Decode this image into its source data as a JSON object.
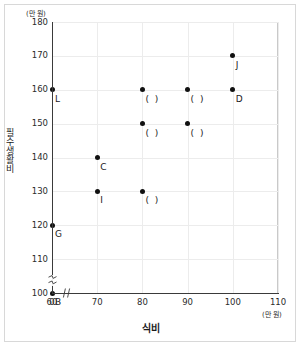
{
  "chart_data": {
    "type": "scatter",
    "title": "",
    "xlabel": "식비",
    "ylabel": "필수생활비",
    "x_unit": "(만 원)",
    "y_unit": "(만 원)",
    "xlim": [
      60,
      110
    ],
    "ylim": [
      100,
      180
    ],
    "grid": true,
    "legend": "none",
    "x_origin_label": "0",
    "x_ticks": [
      "60",
      "70",
      "80",
      "90",
      "100",
      "110"
    ],
    "x_tick_values": [
      60,
      70,
      80,
      90,
      100,
      110
    ],
    "y_ticks": [
      "100",
      "110",
      "120",
      "130",
      "140",
      "150",
      "160",
      "170",
      "180"
    ],
    "y_tick_values": [
      100,
      110,
      120,
      130,
      140,
      150,
      160,
      170,
      180
    ],
    "axis_breaks": {
      "x": true,
      "y": true
    },
    "points": [
      {
        "x": 60,
        "y": 100,
        "label": "B",
        "label_pos": "below-right"
      },
      {
        "x": 60,
        "y": 120,
        "label": "G",
        "label_pos": "below-right"
      },
      {
        "x": 60,
        "y": 160,
        "label": "L",
        "label_pos": "below-right"
      },
      {
        "x": 70,
        "y": 130,
        "label": "I",
        "label_pos": "below-right"
      },
      {
        "x": 70,
        "y": 140,
        "label": "C",
        "label_pos": "below-right"
      },
      {
        "x": 80,
        "y": 130,
        "label": "( )",
        "label_pos": "below-right"
      },
      {
        "x": 80,
        "y": 150,
        "label": "( )",
        "label_pos": "below-right"
      },
      {
        "x": 80,
        "y": 160,
        "label": "( )",
        "label_pos": "below-right"
      },
      {
        "x": 90,
        "y": 150,
        "label": "( )",
        "label_pos": "below-right"
      },
      {
        "x": 90,
        "y": 160,
        "label": "( )",
        "label_pos": "below-right"
      },
      {
        "x": 100,
        "y": 160,
        "label": "D",
        "label_pos": "below-right"
      },
      {
        "x": 100,
        "y": 170,
        "label": "J",
        "label_pos": "below-right"
      }
    ]
  }
}
